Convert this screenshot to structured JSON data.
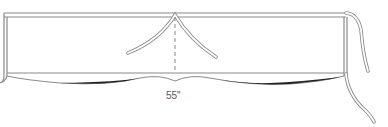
{
  "diagram": {
    "measurement_label": "55\"",
    "colors": {
      "outline": "#8a8a8a",
      "fill": "#ffffff",
      "shadow": "#222222",
      "text": "#555555"
    }
  }
}
